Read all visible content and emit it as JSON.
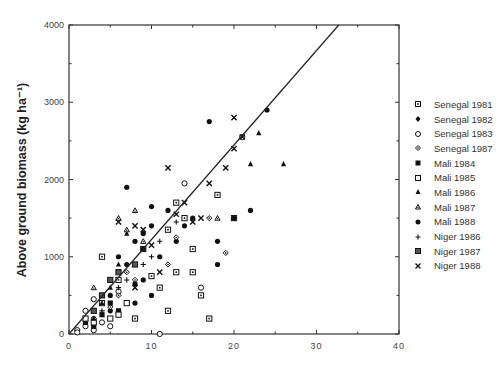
{
  "chart_data": {
    "type": "scatter",
    "title": "",
    "xlabel": "",
    "ylabel": "Above ground biomass (kg ha⁻¹)",
    "xlim": [
      0,
      40
    ],
    "ylim": [
      0,
      4000
    ],
    "x_ticks": [
      "0",
      "10",
      "20",
      "30",
      "40"
    ],
    "y_ticks": [
      "0",
      "1000",
      "2000",
      "3000",
      "4000"
    ],
    "grid": false,
    "legend_position": "right",
    "regression_line": {
      "x0": 0,
      "y0": 0,
      "x1": 32.7,
      "y1": 4000
    },
    "series": [
      {
        "name": "Senegal 1981",
        "marker": "square-dot",
        "points": [
          [
            4,
            1000
          ],
          [
            9,
            1100
          ],
          [
            13,
            1700
          ],
          [
            14,
            1500
          ],
          [
            12,
            1350
          ],
          [
            15,
            1100
          ],
          [
            16,
            500
          ],
          [
            17,
            200
          ],
          [
            13,
            800
          ],
          [
            15,
            800
          ],
          [
            10,
            750
          ],
          [
            6,
            700
          ],
          [
            11,
            600
          ],
          [
            12,
            300
          ],
          [
            8,
            200
          ],
          [
            18,
            1800
          ],
          [
            20,
            1500
          ]
        ]
      },
      {
        "name": "Senegal 1982",
        "marker": "filled-circle",
        "points": [
          [
            9,
            700
          ],
          [
            6,
            1000
          ],
          [
            8,
            1200
          ],
          [
            10,
            1650
          ],
          [
            7,
            1900
          ],
          [
            9,
            1300
          ],
          [
            14,
            1400
          ],
          [
            15,
            1500
          ],
          [
            13,
            1200
          ],
          [
            11,
            1000
          ],
          [
            10,
            500
          ],
          [
            8,
            400
          ],
          [
            5,
            300
          ],
          [
            3,
            200
          ],
          [
            17,
            2750
          ],
          [
            24,
            2900
          ],
          [
            20,
            1500
          ],
          [
            22,
            1600
          ],
          [
            18,
            1200
          ]
        ]
      },
      {
        "name": "Senegal 1983",
        "marker": "open-circle",
        "points": [
          [
            1,
            50
          ],
          [
            2,
            100
          ],
          [
            2,
            300
          ],
          [
            3,
            450
          ],
          [
            4,
            150
          ],
          [
            1,
            20
          ],
          [
            5,
            100
          ],
          [
            14,
            1950
          ],
          [
            21,
            2550
          ],
          [
            11,
            0
          ],
          [
            16,
            600
          ],
          [
            6,
            550
          ],
          [
            3,
            50
          ]
        ]
      },
      {
        "name": "Senegal 1987",
        "marker": "open-diamond",
        "points": [
          [
            3,
            200
          ],
          [
            5,
            350
          ],
          [
            6,
            500
          ],
          [
            8,
            700
          ],
          [
            12,
            900
          ],
          [
            13,
            1250
          ],
          [
            17,
            1500
          ],
          [
            19,
            1050
          ],
          [
            7,
            800
          ]
        ]
      },
      {
        "name": "Mali 1984",
        "marker": "filled-square",
        "points": [
          [
            3,
            100
          ],
          [
            4,
            250
          ],
          [
            5,
            400
          ],
          [
            2,
            150
          ],
          [
            6,
            300
          ]
        ]
      },
      {
        "name": "Mali 1985",
        "marker": "open-square",
        "points": [
          [
            2,
            200
          ],
          [
            4,
            400
          ],
          [
            5,
            200
          ],
          [
            3,
            150
          ],
          [
            6,
            250
          ],
          [
            7,
            400
          ]
        ]
      },
      {
        "name": "Mali 1986",
        "marker": "filled-triangle",
        "points": [
          [
            3,
            200
          ],
          [
            4,
            400
          ],
          [
            5,
            600
          ],
          [
            6,
            900
          ],
          [
            7,
            1300
          ],
          [
            23,
            2600
          ],
          [
            22,
            2200
          ],
          [
            26,
            2200
          ]
        ]
      },
      {
        "name": "Mali 1987",
        "marker": "open-triangle",
        "points": [
          [
            6,
            1500
          ],
          [
            7,
            1350
          ],
          [
            8,
            1600
          ],
          [
            9,
            1200
          ],
          [
            18,
            1500
          ],
          [
            3,
            600
          ]
        ]
      },
      {
        "name": "Mali 1988",
        "marker": "filled-circle",
        "points": [
          [
            5,
            500
          ],
          [
            7,
            900
          ],
          [
            8,
            650
          ],
          [
            9,
            1100
          ],
          [
            10,
            1400
          ],
          [
            12,
            1600
          ],
          [
            18,
            900
          ]
        ]
      },
      {
        "name": "Niger 1986",
        "marker": "plus",
        "points": [
          [
            4,
            300
          ],
          [
            6,
            600
          ],
          [
            7,
            700
          ],
          [
            9,
            900
          ],
          [
            10,
            1000
          ],
          [
            11,
            1200
          ],
          [
            13,
            1450
          ]
        ]
      },
      {
        "name": "Niger 1987",
        "marker": "filled-square-dot",
        "points": [
          [
            3,
            300
          ],
          [
            4,
            500
          ],
          [
            5,
            700
          ],
          [
            6,
            800
          ],
          [
            8,
            900
          ]
        ]
      },
      {
        "name": "Niger 1988",
        "marker": "cross",
        "points": [
          [
            6,
            1450
          ],
          [
            8,
            1400
          ],
          [
            9,
            1350
          ],
          [
            12,
            2150
          ],
          [
            20,
            2800
          ],
          [
            21,
            2550
          ],
          [
            20,
            2400
          ],
          [
            19,
            2150
          ],
          [
            17,
            1950
          ],
          [
            14,
            1700
          ],
          [
            13,
            1550
          ],
          [
            15,
            1450
          ],
          [
            10,
            1150
          ],
          [
            11,
            800
          ],
          [
            8,
            600
          ],
          [
            16,
            1500
          ]
        ]
      }
    ]
  },
  "legend": {
    "items": [
      {
        "label": "Senegal 1981",
        "marker": "square-dot"
      },
      {
        "label": "Senegal 1982",
        "marker": "filled-diamond"
      },
      {
        "label": "Senegal 1983",
        "marker": "open-circle"
      },
      {
        "label": "Senegal 1987",
        "marker": "open-diamond"
      },
      {
        "label": "Mali 1984",
        "marker": "filled-square"
      },
      {
        "label": "Mali 1985",
        "marker": "open-square"
      },
      {
        "label": "Mali 1986",
        "marker": "filled-triangle"
      },
      {
        "label": "Mali 1987",
        "marker": "open-triangle"
      },
      {
        "label": "Mali 1988",
        "marker": "filled-circle"
      },
      {
        "label": "Niger 1986",
        "marker": "plus"
      },
      {
        "label": "Niger 1987",
        "marker": "filled-square-dot"
      },
      {
        "label": "Niger 1988",
        "marker": "cross"
      }
    ]
  }
}
